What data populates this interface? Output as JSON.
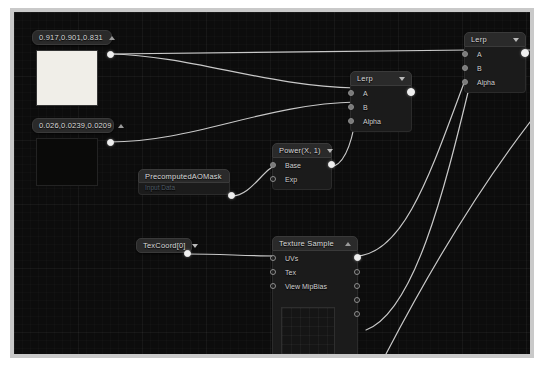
{
  "app": {
    "title": "Material Graph Editor",
    "canvas_background": "#0c0c0c",
    "wire_color": "#d9d9d9",
    "node_header_color": "#2a2a2a",
    "node_body_color": "#1b1b1b"
  },
  "nodes": {
    "const_bright": {
      "title": "0.917,0.901,0.831",
      "caret": "up-caret-icon",
      "preview_color": "#f0eee8",
      "output_pin": "out"
    },
    "const_dark": {
      "title": "0.026,0.0239,0.0209",
      "caret": "up-caret-icon",
      "preview_color": "#0a0a09",
      "output_pin": "out"
    },
    "precomputed_ao": {
      "title": "PrecomputedAOMask",
      "subtitle": "Input Data",
      "output_pin": "out"
    },
    "power": {
      "title": "Power(X, 1)",
      "caret": "down-caret-icon",
      "inputs": [
        "Base",
        "Exp"
      ],
      "output_pin": "out"
    },
    "texcoord": {
      "title": "TexCoord[0]",
      "caret": "down-caret-icon",
      "output_pin": "out"
    },
    "texture_sample": {
      "title": "Texture Sample",
      "caret": "up-caret-icon",
      "inputs": [
        "UVs",
        "Tex",
        "View MipBias"
      ],
      "outputs": [
        "RGB",
        "R",
        "G",
        "B",
        "A"
      ]
    },
    "lerp_mid": {
      "title": "Lerp",
      "caret": "down-caret-icon",
      "inputs": [
        "A",
        "B",
        "Alpha"
      ],
      "output_pin": "out"
    },
    "lerp_right": {
      "title": "Lerp",
      "caret": "down-caret-icon",
      "inputs": [
        "A",
        "B",
        "Alpha"
      ],
      "output_pin": "out"
    }
  }
}
